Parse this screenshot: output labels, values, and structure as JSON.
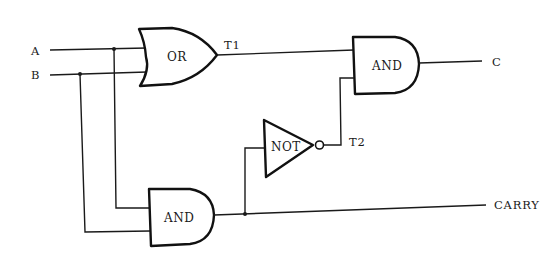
{
  "diagram": {
    "type": "logic-circuit",
    "inputs": [
      {
        "id": "A",
        "label": "A"
      },
      {
        "id": "B",
        "label": "B"
      }
    ],
    "gates": [
      {
        "id": "or1",
        "type": "OR",
        "label": "OR",
        "inputs": [
          "A",
          "B"
        ],
        "output": "T1"
      },
      {
        "id": "and_carry",
        "type": "AND",
        "label": "AND",
        "inputs": [
          "A",
          "B"
        ],
        "output": "CARRY"
      },
      {
        "id": "not1",
        "type": "NOT",
        "label": "NOT",
        "inputs": [
          "CARRY"
        ],
        "output": "T2"
      },
      {
        "id": "and_sum",
        "type": "AND",
        "label": "AND",
        "inputs": [
          "T1",
          "T2"
        ],
        "output": "C"
      }
    ],
    "signals": {
      "t1": "T1",
      "t2": "T2"
    },
    "outputs": [
      {
        "id": "C",
        "label": "C"
      },
      {
        "id": "CARRY",
        "label": "CARRY"
      }
    ]
  }
}
